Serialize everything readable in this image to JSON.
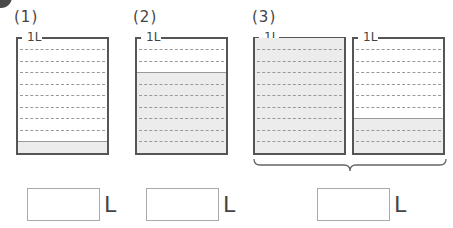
{
  "problems": [
    {
      "label": "(1)",
      "beakers": [
        {
          "capacity_label": "1L",
          "fill_tenths": 1
        }
      ],
      "unit": "L"
    },
    {
      "label": "(2)",
      "beakers": [
        {
          "capacity_label": "1L",
          "fill_tenths": 7
        }
      ],
      "unit": "L"
    },
    {
      "label": "(3)",
      "beakers": [
        {
          "capacity_label": "1L",
          "fill_tenths": 10
        },
        {
          "capacity_label": "1L",
          "fill_tenths": 3
        }
      ],
      "unit": "L"
    }
  ],
  "colors": {
    "fill": "#ececec",
    "outline": "#555555",
    "dash": "#999999"
  }
}
